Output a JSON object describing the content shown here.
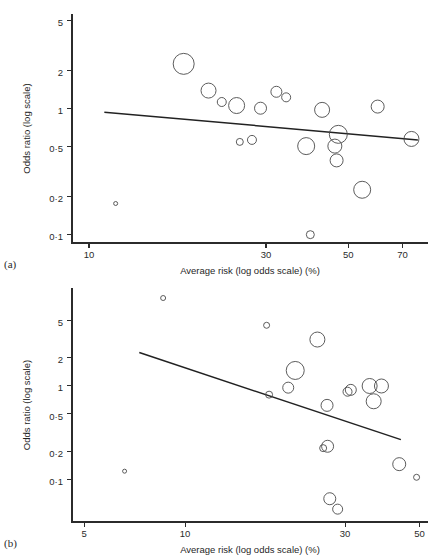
{
  "figure": {
    "panels": [
      {
        "id": "a",
        "label": "(a)",
        "xlabel": "Average risk (log odds scale) (%)",
        "ylabel": "Odds ratio (log scale)"
      },
      {
        "id": "b",
        "label": "(b)",
        "xlabel": "Average risk (log odds scale) (%)",
        "ylabel": "Odds ratio (log scale)"
      }
    ]
  },
  "chart_data": [
    {
      "type": "scatter",
      "panel": "a",
      "title": "",
      "xlabel": "Average risk (log odds scale) (%)",
      "ylabel": "Odds ratio (log scale)",
      "xscale": "log",
      "yscale": "log",
      "xlim": [
        9.0,
        82.0
      ],
      "ylim": [
        0.085,
        5.6
      ],
      "xticks": [
        10,
        30,
        50,
        70
      ],
      "xticklabels": [
        "10",
        "30",
        "50",
        "70"
      ],
      "yticks": [
        5,
        2,
        1,
        0.5,
        0.2,
        0.1
      ],
      "yticklabels": [
        "5",
        "2",
        "1",
        "0·5",
        "0·2",
        "0·1"
      ],
      "grid": false,
      "legend": null,
      "marker": "open-circle-sized-by-weight",
      "points": [
        {
          "x": 11.8,
          "y": 0.175,
          "size": 2.0
        },
        {
          "x": 18.0,
          "y": 2.25,
          "size": 10.5
        },
        {
          "x": 21.0,
          "y": 1.38,
          "size": 7.5
        },
        {
          "x": 22.8,
          "y": 1.12,
          "size": 4.5
        },
        {
          "x": 25.0,
          "y": 1.05,
          "size": 8.0
        },
        {
          "x": 25.5,
          "y": 0.54,
          "size": 3.5
        },
        {
          "x": 27.5,
          "y": 0.56,
          "size": 4.5
        },
        {
          "x": 29.0,
          "y": 1.0,
          "size": 6.0
        },
        {
          "x": 32.0,
          "y": 1.35,
          "size": 5.5
        },
        {
          "x": 34.0,
          "y": 1.22,
          "size": 4.5
        },
        {
          "x": 38.5,
          "y": 0.5,
          "size": 8.5
        },
        {
          "x": 39.5,
          "y": 0.099,
          "size": 4.0
        },
        {
          "x": 42.5,
          "y": 0.97,
          "size": 7.5
        },
        {
          "x": 46.0,
          "y": 0.5,
          "size": 7.0
        },
        {
          "x": 47.0,
          "y": 0.62,
          "size": 9.0
        },
        {
          "x": 46.5,
          "y": 0.385,
          "size": 6.5
        },
        {
          "x": 54.5,
          "y": 0.225,
          "size": 8.5
        },
        {
          "x": 60.0,
          "y": 1.03,
          "size": 6.5
        },
        {
          "x": 74.0,
          "y": 0.57,
          "size": 7.5
        }
      ],
      "regression_line": {
        "x_start": 11.0,
        "y_start": 0.93,
        "x_end": 77.0,
        "y_end": 0.56
      }
    },
    {
      "type": "scatter",
      "panel": "b",
      "title": "",
      "xlabel": "Average risk (log odds scale) (%)",
      "ylabel": "Odds ratio (log scale)",
      "xscale": "log",
      "yscale": "log",
      "xlim": [
        4.6,
        53.0
      ],
      "ylim": [
        0.035,
        11.0
      ],
      "xticks": [
        5,
        10,
        30,
        50
      ],
      "xticklabels": [
        "5",
        "10",
        "30",
        "50"
      ],
      "yticks": [
        5,
        2,
        1,
        0.5,
        0.2,
        0.1
      ],
      "yticklabels": [
        "5",
        "2",
        "1",
        "0·5",
        "0·2",
        "0·1"
      ],
      "grid": false,
      "legend": null,
      "marker": "open-circle-sized-by-weight",
      "points": [
        {
          "x": 6.6,
          "y": 0.122,
          "size": 2.0
        },
        {
          "x": 8.6,
          "y": 8.6,
          "size": 2.5
        },
        {
          "x": 17.5,
          "y": 4.4,
          "size": 3.0
        },
        {
          "x": 17.8,
          "y": 0.8,
          "size": 3.5
        },
        {
          "x": 20.3,
          "y": 0.95,
          "size": 5.5
        },
        {
          "x": 21.3,
          "y": 1.45,
          "size": 9.0
        },
        {
          "x": 24.8,
          "y": 3.1,
          "size": 7.5
        },
        {
          "x": 25.8,
          "y": 0.215,
          "size": 3.5
        },
        {
          "x": 26.6,
          "y": 0.225,
          "size": 6.0
        },
        {
          "x": 26.5,
          "y": 0.615,
          "size": 6.0
        },
        {
          "x": 27.0,
          "y": 0.062,
          "size": 6.0
        },
        {
          "x": 28.5,
          "y": 0.048,
          "size": 5.0
        },
        {
          "x": 30.5,
          "y": 0.86,
          "size": 4.5
        },
        {
          "x": 31.2,
          "y": 0.9,
          "size": 5.5
        },
        {
          "x": 35.5,
          "y": 0.99,
          "size": 7.5
        },
        {
          "x": 38.5,
          "y": 0.99,
          "size": 7.0
        },
        {
          "x": 36.5,
          "y": 0.68,
          "size": 7.5
        },
        {
          "x": 43.5,
          "y": 0.145,
          "size": 6.5
        },
        {
          "x": 49.0,
          "y": 0.105,
          "size": 3.0
        }
      ],
      "regression_line": {
        "x_start": 7.3,
        "y_start": 2.25,
        "x_end": 44.0,
        "y_end": 0.265
      }
    }
  ]
}
